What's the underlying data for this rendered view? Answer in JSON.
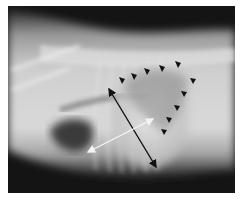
{
  "image": {
    "kind": "lateral thoracic radiograph",
    "background": "#ffffff",
    "annotations": {
      "arrowheads": {
        "color": "#111111",
        "count": 10,
        "points": [
          [
            122,
            80
          ],
          [
            134,
            76
          ],
          [
            147,
            71
          ],
          [
            162,
            68
          ],
          [
            178,
            64
          ],
          [
            193,
            80
          ],
          [
            184,
            93
          ],
          [
            177,
            107
          ],
          [
            169,
            119
          ],
          [
            164,
            131
          ]
        ]
      },
      "black_arrow": {
        "color": "#111111",
        "from": [
          109,
          89
        ],
        "to": [
          156,
          167
        ],
        "double_headed": true
      },
      "white_arrow": {
        "color": "#f2f2f2",
        "from": [
          88,
          152
        ],
        "to": [
          153,
          119
        ],
        "double_headed": true
      }
    }
  }
}
